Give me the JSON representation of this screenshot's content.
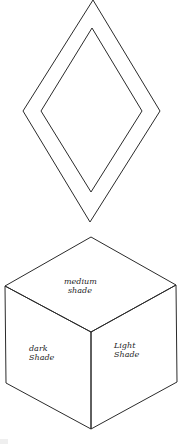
{
  "diagram": {
    "title": "",
    "shapes": [
      {
        "id": "outer-diamond",
        "type": "rhombus"
      },
      {
        "id": "inner-diamond",
        "type": "rhombus"
      },
      {
        "id": "cube",
        "type": "isometric-cube"
      }
    ],
    "cube_faces": {
      "top": {
        "line1": "medium",
        "line2": "shade"
      },
      "left": {
        "line1": "dark",
        "line2": "Shade"
      },
      "right": {
        "line1": "Light",
        "line2": "Shade"
      }
    },
    "colors": {
      "line": "#2b2b2b",
      "background": "#ffffff"
    }
  }
}
